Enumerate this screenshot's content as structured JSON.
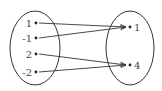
{
  "diagram": {
    "type": "mapping",
    "domain": {
      "elements": [
        {
          "label": "1",
          "x": 36,
          "y": 23
        },
        {
          "label": "-1",
          "x": 36,
          "y": 38
        },
        {
          "label": "2",
          "x": 36,
          "y": 54
        },
        {
          "label": "-2",
          "x": 36,
          "y": 72
        }
      ],
      "ellipse": {
        "cx": 35,
        "cy": 48,
        "rx": 25,
        "ry": 37
      }
    },
    "codomain": {
      "elements": [
        {
          "label": "1",
          "x": 130,
          "y": 27
        },
        {
          "label": "4",
          "x": 130,
          "y": 65
        }
      ],
      "ellipse": {
        "cx": 130,
        "cy": 48,
        "rx": 24,
        "ry": 37
      }
    },
    "mappings": [
      {
        "from": 0,
        "to": 0
      },
      {
        "from": 1,
        "to": 0
      },
      {
        "from": 2,
        "to": 1
      },
      {
        "from": 3,
        "to": 1
      }
    ],
    "colors": {
      "stroke": "#333333",
      "text": "#444444"
    }
  }
}
